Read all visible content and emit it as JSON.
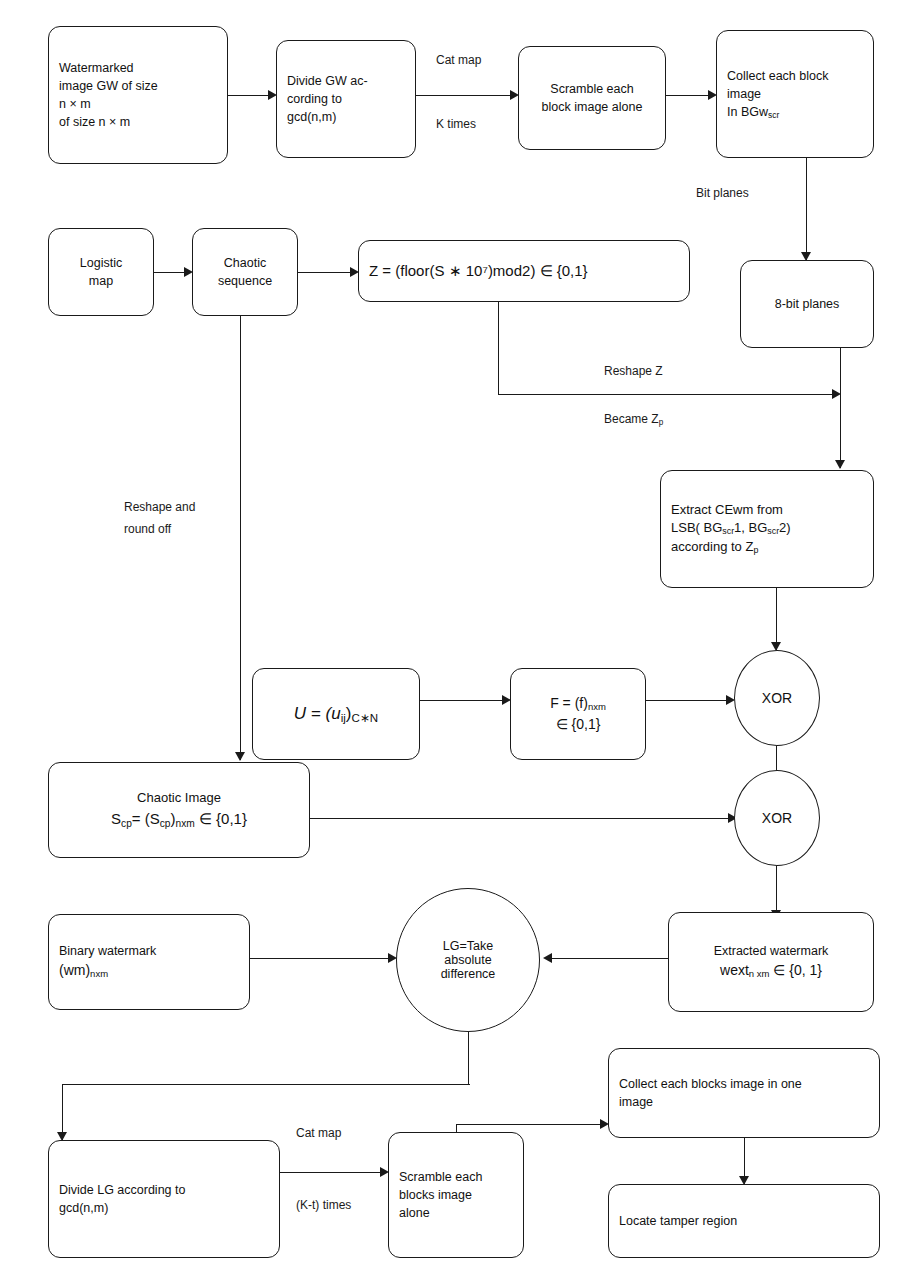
{
  "diagram": {
    "line_color": "#1a1a1a",
    "background": "#ffffff"
  },
  "nodes": {
    "watermarked_image": {
      "line1": "Watermarked",
      "line2": "image GW of size",
      "line3": "n × m",
      "line4": "of size n × m"
    },
    "divide_gw": {
      "line1": "Divide GW ac-",
      "line2": "cording to",
      "line3": "gcd(n,m)"
    },
    "scramble_block": {
      "line1": "Scramble each",
      "line2": "block image alone"
    },
    "collect_block": {
      "line1": "Collect each block",
      "line2": "image",
      "line3": "In BGw",
      "sub3": "scr"
    },
    "logistic_map": {
      "line1": "Logistic",
      "line2": "map"
    },
    "chaotic_sequence": {
      "line1": "Chaotic",
      "line2": "sequence"
    },
    "z_equation": {
      "text": "Z = (floor(S ∗ 10⁷)mod2) ∈ {0,1}"
    },
    "eight_bit_planes": {
      "text": "8-bit planes"
    },
    "extract_cewm": {
      "line1": "Extract CEwm  from",
      "line2": "LSB( BG",
      "sub2a": "scr",
      "line2b": "1, BG",
      "sub2b": "scr",
      "line2c": "2)",
      "line3": "according to Z",
      "sub3": "p"
    },
    "u_matrix": {
      "text": "U = (u",
      "sub_a": "ij",
      "text_b": ")",
      "sub_b": "C∗N"
    },
    "f_matrix": {
      "line1": "F = (f)",
      "sub1": "nxm",
      "line2": "∈ {0,1}"
    },
    "xor_top": {
      "text": "XOR"
    },
    "xor_bottom": {
      "text": "XOR"
    },
    "chaotic_image": {
      "line1": "Chaotic Image",
      "line2a": "S",
      "sub2a": "cp",
      "line2b": "= (S",
      "sub2b": "cp",
      "line2c": ")",
      "sub2c": "nxm",
      "line2d": " ∈ {0,1}"
    },
    "binary_watermark": {
      "line1": "Binary watermark",
      "line2": "(wm)",
      "sub2": "nxm"
    },
    "lg_circle": {
      "line1": "LG=Take",
      "line2": "absolute",
      "line3": "difference"
    },
    "extracted_wm": {
      "line1": "Extracted watermark",
      "line2": "wext",
      "sub2": "n xm",
      "line2b": " ∈ {0, 1}"
    },
    "divide_lg": {
      "line1": "Divide LG according to",
      "line2": "gcd(n,m)"
    },
    "scramble_blocks": {
      "line1": "Scramble each",
      "line2": "blocks image",
      "line3": "alone"
    },
    "collect_blocks": {
      "line1": "Collect each blocks image in one",
      "line2": "image"
    },
    "locate_tamper": {
      "text": "Locate tamper region"
    }
  },
  "edge_labels": {
    "cat_map_top": "Cat map",
    "k_times": "K times",
    "bit_planes": "Bit planes",
    "reshape_z": "Reshape Z",
    "became_zp": "Became Z",
    "became_zp_sub": "p",
    "reshape_round1": "Reshape and",
    "reshape_round2": "round off",
    "cat_map_bottom": "Cat map",
    "k_t_times": "(K-t) times"
  }
}
